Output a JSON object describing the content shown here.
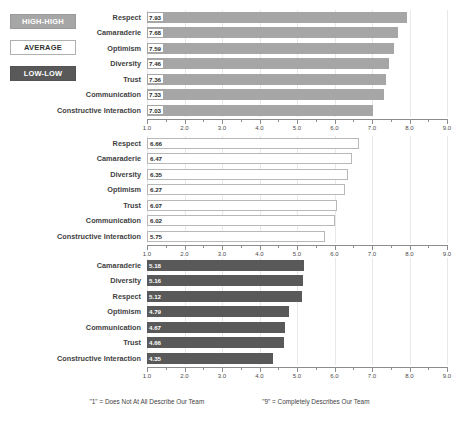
{
  "legend": {
    "items": [
      {
        "label": "HIGH-HIGH",
        "name": "legend-high-high",
        "color": "#a6a6a6"
      },
      {
        "label": "AVERAGE",
        "name": "legend-average",
        "color": "#ffffff"
      },
      {
        "label": "LOW-LOW",
        "name": "legend-low-low",
        "color": "#595959"
      }
    ]
  },
  "footnote": {
    "left": "\"1\" = Does Not At All Describe Our Team",
    "right": "\"9\" = Completely Describes Our Team"
  },
  "axis": {
    "ticks": [
      "1.0",
      "2.0",
      "3.0",
      "4.0",
      "5.0",
      "6.0",
      "7.0",
      "8.0",
      "9.0"
    ],
    "min": 1.0,
    "max": 9.0
  },
  "chart_data": [
    {
      "type": "bar",
      "name": "high-high",
      "title": "HIGH-HIGH",
      "orientation": "horizontal",
      "categories": [
        "Respect",
        "Camaraderie",
        "Optimism",
        "Diversity",
        "Trust",
        "Communication",
        "Constructive Interaction"
      ],
      "values": [
        7.93,
        7.68,
        7.59,
        7.46,
        7.36,
        7.33,
        7.03
      ],
      "labels": [
        "7.93",
        "7.68",
        "7.59",
        "7.46",
        "7.36",
        "7.33",
        "7.03"
      ],
      "bar_color": "#a6a6a6",
      "xlabel": "",
      "ylabel": "",
      "xlim": [
        1.0,
        9.0
      ],
      "grid": true
    },
    {
      "type": "bar",
      "name": "average",
      "title": "AVERAGE",
      "orientation": "horizontal",
      "categories": [
        "Respect",
        "Camaraderie",
        "Diversity",
        "Optimism",
        "Trust",
        "Communication",
        "Constructive Interaction"
      ],
      "values": [
        6.66,
        6.47,
        6.35,
        6.27,
        6.07,
        6.02,
        5.75
      ],
      "labels": [
        "6.66",
        "6.47",
        "6.35",
        "6.27",
        "6.07",
        "6.02",
        "5.75"
      ],
      "bar_color": "#ffffff",
      "xlabel": "",
      "ylabel": "",
      "xlim": [
        1.0,
        9.0
      ],
      "grid": true
    },
    {
      "type": "bar",
      "name": "low-low",
      "title": "LOW-LOW",
      "orientation": "horizontal",
      "categories": [
        "Camaraderie",
        "Diversity",
        "Respect",
        "Optimism",
        "Communication",
        "Trust",
        "Constructive Interaction"
      ],
      "values": [
        5.18,
        5.16,
        5.12,
        4.79,
        4.67,
        4.66,
        4.35
      ],
      "labels": [
        "5.18",
        "5.16",
        "5.12",
        "4.79",
        "4.67",
        "4.66",
        "4.35"
      ],
      "bar_color": "#595959",
      "xlabel": "",
      "ylabel": "",
      "xlim": [
        1.0,
        9.0
      ],
      "grid": true
    }
  ]
}
